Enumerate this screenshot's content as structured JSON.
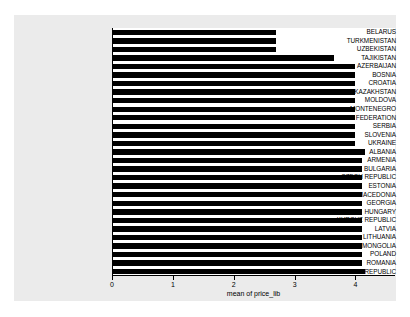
{
  "chart_data": {
    "type": "bar",
    "orientation": "horizontal",
    "title": "",
    "subtitle": "",
    "xlabel": "mean of price_lib",
    "ylabel": "",
    "xlim": [
      0,
      4.65
    ],
    "xticks": [
      0,
      1,
      2,
      3,
      4
    ],
    "xtick_labels": [
      "0",
      "1",
      "2",
      "3",
      "4"
    ],
    "grid": false,
    "legend": null,
    "bar_color": "#000000",
    "plot_background": "#ffffff",
    "figure_background": "#ebebeb",
    "categories": [
      "BELARUS",
      "TURKMENISTAN",
      "UZBEKISTAN",
      "TAJIKISTAN",
      "AZERBAIJAN",
      "BOSNIA",
      "CROATIA",
      "KAZAKHSTAN",
      "MOLDOVA",
      "MONTENEGRO",
      "RUSSIAN FEDERATION",
      "SERBIA",
      "SLOVENIA",
      "UKRAINE",
      "ALBANIA",
      "ARMENIA",
      "BULGARIA",
      "CZECH REPUBLIC",
      "ESTONIA",
      "FYR MACEDONIA",
      "GEORGIA",
      "HUNGARY",
      "KYRGYZ REPUBLIC",
      "LATVIA",
      "LITHUANIA",
      "MONGOLIA",
      "POLAND",
      "ROMANIA",
      "SLOVAK REPUBLIC"
    ],
    "values": [
      2.7,
      2.7,
      2.7,
      3.65,
      4.0,
      4.0,
      4.0,
      4.0,
      4.0,
      4.0,
      4.0,
      4.0,
      4.0,
      4.0,
      4.15,
      4.1,
      4.1,
      4.1,
      4.1,
      4.1,
      4.1,
      4.1,
      4.1,
      4.1,
      4.1,
      4.1,
      4.1,
      4.1,
      4.15
    ]
  }
}
